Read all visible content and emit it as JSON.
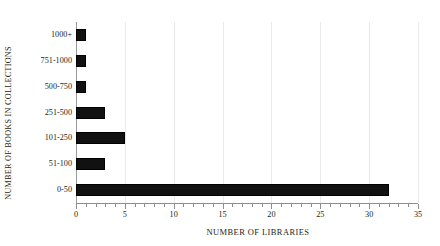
{
  "chart_data": {
    "type": "bar",
    "orientation": "horizontal",
    "title": "",
    "xlabel": "NUMBER OF LIBRARIES",
    "ylabel": "NUMBER OF BOOKS IN COLLECTIONS",
    "categories": [
      "0-50",
      "51-100",
      "101-250",
      "251-500",
      "500-750",
      "751-1000",
      "1000+"
    ],
    "values": [
      32,
      3,
      5,
      3,
      1,
      1,
      1
    ],
    "xlim": [
      0,
      35
    ],
    "xticks": [
      0,
      5,
      10,
      15,
      20,
      25,
      30,
      35
    ],
    "xtick_labels": [
      "0",
      "5",
      "10",
      "15",
      "20",
      "25",
      "30",
      "35"
    ],
    "x_minor_tick_step": 1,
    "grid": "vertical-major",
    "legend": "none",
    "bar_color": "#111111",
    "grid_color": "#e9e9ea",
    "axis_color": "#8e8e91",
    "text_color": "#231f20"
  }
}
